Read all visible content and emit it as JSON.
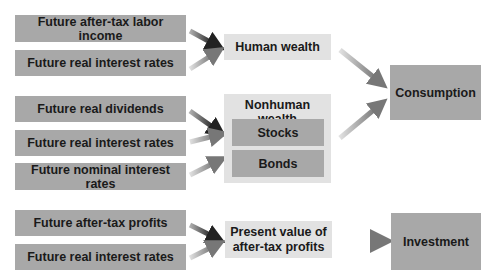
{
  "diagram": {
    "sources": [
      {
        "id": "s1",
        "label": "Future after-tax labor income"
      },
      {
        "id": "s2",
        "label": "Future real interest rates"
      },
      {
        "id": "s3",
        "label": "Future real dividends"
      },
      {
        "id": "s4",
        "label": "Future real interest rates"
      },
      {
        "id": "s5",
        "label": "Future nominal interest rates"
      },
      {
        "id": "s6",
        "label": "Future after-tax profits"
      },
      {
        "id": "s7",
        "label": "Future real interest rates"
      }
    ],
    "human_wealth": {
      "label": "Human wealth"
    },
    "nonhuman_wealth": {
      "label": "Nonhuman wealth",
      "components": [
        {
          "label": "Stocks"
        },
        {
          "label": "Bonds"
        }
      ]
    },
    "present_value": {
      "label_line1": "Present value of",
      "label_line2": "after-tax profits"
    },
    "consumption": {
      "label": "Consumption"
    },
    "investment": {
      "label": "Investment"
    },
    "colors": {
      "dark_box": "#a8a8a8",
      "light_box": "#e2e2e2",
      "text": "#1a1a1a"
    }
  }
}
